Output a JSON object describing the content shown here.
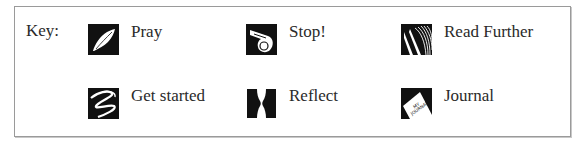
{
  "key": {
    "label": "Key:",
    "items": [
      {
        "label": "Pray",
        "icon": "feather-icon"
      },
      {
        "label": "Stop!",
        "icon": "whistle-icon"
      },
      {
        "label": "Read Further",
        "icon": "book-pages-icon"
      },
      {
        "label": "Get started",
        "icon": "squiggle-icon"
      },
      {
        "label": "Reflect",
        "icon": "faces-vase-icon"
      },
      {
        "label": "Journal",
        "icon": "journal-icon"
      }
    ]
  }
}
